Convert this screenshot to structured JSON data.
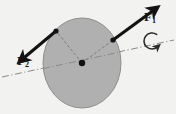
{
  "figure": {
    "type": "physics-free-body-diagram",
    "canvas": {
      "width": 176,
      "height": 114
    },
    "background_color": "#f2f2f0"
  },
  "body": {
    "name": "disk",
    "shape": "ellipse",
    "center": {
      "x": 82,
      "y": 63
    },
    "radius_x": 39,
    "radius_y": 45,
    "fill_color": "#b0b0b0",
    "stroke_color": "#8e8e8e",
    "stroke_width": 1
  },
  "pivot": {
    "name": "center-of-rotation",
    "x": 82,
    "y": 63,
    "radius": 3.2,
    "color": "#111111"
  },
  "axis": {
    "name": "rotation-axis",
    "style": "dash-dot",
    "color": "#8a8a8a",
    "stroke_width": 1,
    "x1": 2,
    "y1": 77,
    "x2": 174,
    "y2": 40
  },
  "rotation_arrow": {
    "name": "rotation-direction",
    "sense": "counterclockwise",
    "center": {
      "x": 152,
      "y": 41
    },
    "radius": 8,
    "color": "#2a2a2a",
    "stroke_width": 1.6
  },
  "forces": [
    {
      "id": "F1",
      "label": "F",
      "subscript": "1",
      "application_point": {
        "x": 113,
        "y": 40
      },
      "tip": {
        "x": 158,
        "y": 7
      },
      "color": "#131313",
      "shaft_width": 3.1,
      "direction_deg": 36,
      "label_position": {
        "x": 144,
        "y": 10
      }
    },
    {
      "id": "F2",
      "label": "F",
      "subscript": "2",
      "application_point": {
        "x": 56,
        "y": 31
      },
      "tip": {
        "x": 19,
        "y": 62
      },
      "color": "#131313",
      "shaft_width": 3.1,
      "direction_deg": 220,
      "label_position": {
        "x": 17,
        "y": 54
      }
    }
  ],
  "moment_arms": [
    {
      "name": "moment-arm-to-F1",
      "from": {
        "x": 82,
        "y": 63
      },
      "to": {
        "x": 113,
        "y": 40
      },
      "style": "dashed",
      "color": "#7d7d7d"
    },
    {
      "name": "moment-arm-to-F2",
      "from": {
        "x": 82,
        "y": 63
      },
      "to": {
        "x": 56,
        "y": 31
      },
      "style": "dashed",
      "color": "#7d7d7d"
    }
  ]
}
